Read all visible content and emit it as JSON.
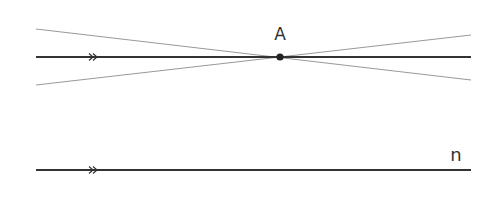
{
  "diagram": {
    "point_label": "A",
    "line_label": "n",
    "colors": {
      "thick_line": "#333333",
      "thin_line": "#999999",
      "point": "#222222"
    },
    "point": {
      "x": 280,
      "y": 57
    },
    "upper_line": {
      "x1": 36,
      "y1": 57,
      "x2": 471,
      "y2": 57
    },
    "line_n": {
      "x1": 36,
      "y1": 170,
      "x2": 471,
      "y2": 170
    },
    "secant_lines": [
      {
        "x1": 36,
        "y1": 29,
        "x2": 471,
        "y2": 80
      },
      {
        "x1": 36,
        "y1": 85,
        "x2": 471,
        "y2": 35
      }
    ],
    "parallel_marks": "double-arrow"
  }
}
